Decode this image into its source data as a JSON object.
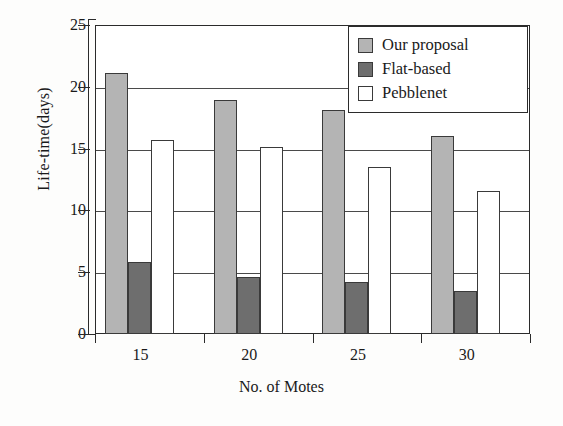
{
  "chart_data": {
    "type": "bar",
    "title": "",
    "xlabel": "No. of Motes",
    "ylabel": "Life-time(days)",
    "categories": [
      "15",
      "20",
      "25",
      "30"
    ],
    "series": [
      {
        "name": "Our proposal",
        "color": "#b4b4b4",
        "values": [
          21.1,
          18.9,
          18.1,
          16.0
        ]
      },
      {
        "name": "Flat-based",
        "color": "#6e6e6e",
        "values": [
          5.8,
          4.6,
          4.2,
          3.5
        ]
      },
      {
        "name": "Pebblenet",
        "color": "#ffffff",
        "values": [
          15.7,
          15.1,
          13.5,
          11.6
        ]
      }
    ],
    "ylim": [
      0,
      25
    ],
    "yticks": [
      0,
      5,
      10,
      15,
      20,
      25
    ],
    "ytick_labels": [
      "0",
      "5",
      "10",
      "15",
      "20",
      "25"
    ],
    "grid": true,
    "grid_axis": "y",
    "legend_position": "upper right",
    "bar_edge_color": "#3a3a3a",
    "axis_color": "#2b2b2b",
    "background": "#ffffff"
  },
  "legend": {
    "entries": [
      {
        "label": "Our proposal"
      },
      {
        "label": "Flat-based"
      },
      {
        "label": "Pebblenet"
      }
    ]
  },
  "axes": {
    "y_title": "Life-time(days)",
    "x_title": "No. of Motes"
  }
}
